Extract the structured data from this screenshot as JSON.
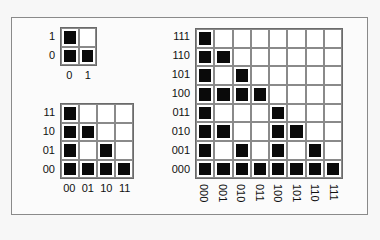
{
  "colors": {
    "filled": "#0a0a0a",
    "grid_line": "#8a8a8a",
    "frame": "#8a8a8a",
    "background": "#fbfbfb"
  },
  "diagrams": [
    {
      "name": "grid-2x2",
      "size": 2,
      "row_labels": [
        "1",
        "0"
      ],
      "col_labels": [
        "0",
        "1"
      ],
      "rows": [
        [
          1,
          0
        ],
        [
          1,
          1
        ]
      ]
    },
    {
      "name": "grid-4x4",
      "size": 4,
      "row_labels": [
        "11",
        "10",
        "01",
        "00"
      ],
      "col_labels": [
        "00",
        "01",
        "10",
        "11"
      ],
      "rows": [
        [
          1,
          0,
          0,
          0
        ],
        [
          1,
          1,
          0,
          0
        ],
        [
          1,
          0,
          1,
          0
        ],
        [
          1,
          1,
          1,
          1
        ]
      ]
    },
    {
      "name": "grid-8x8",
      "size": 8,
      "row_labels": [
        "111",
        "110",
        "101",
        "100",
        "011",
        "010",
        "001",
        "000"
      ],
      "col_labels": [
        "000",
        "001",
        "010",
        "011",
        "100",
        "101",
        "110",
        "111"
      ],
      "rows": [
        [
          1,
          0,
          0,
          0,
          0,
          0,
          0,
          0
        ],
        [
          1,
          1,
          0,
          0,
          0,
          0,
          0,
          0
        ],
        [
          1,
          0,
          1,
          0,
          0,
          0,
          0,
          0
        ],
        [
          1,
          1,
          1,
          1,
          0,
          0,
          0,
          0
        ],
        [
          1,
          0,
          0,
          0,
          1,
          0,
          0,
          0
        ],
        [
          1,
          1,
          0,
          0,
          1,
          1,
          0,
          0
        ],
        [
          1,
          0,
          1,
          0,
          1,
          0,
          1,
          0
        ],
        [
          1,
          1,
          1,
          1,
          1,
          1,
          1,
          1
        ]
      ]
    }
  ]
}
